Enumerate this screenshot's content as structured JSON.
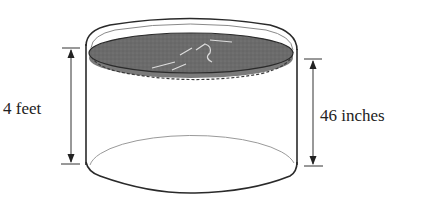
{
  "diagram": {
    "labels": {
      "pool_height": "4 feet",
      "water_depth": "46 inches"
    },
    "colors": {
      "water": "#6b6b6b",
      "outline": "#2a2a2a",
      "inner_rim": "#9a9a9a",
      "background": "#ffffff"
    }
  }
}
